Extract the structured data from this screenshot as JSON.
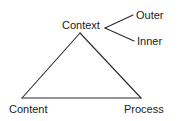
{
  "diagram": {
    "type": "triangle-relationship-diagram",
    "background_color": "#ffffff",
    "line_color": "#2b2b2b",
    "text_color": "#1a1a1a",
    "nodes": [
      {
        "id": "context",
        "label": "Context",
        "position": "apex"
      },
      {
        "id": "content",
        "label": "Content",
        "position": "bottom-left"
      },
      {
        "id": "process",
        "label": "Process",
        "position": "bottom-right"
      },
      {
        "id": "outer",
        "label": "Outer",
        "position": "right-upper"
      },
      {
        "id": "inner",
        "label": "Inner",
        "position": "right-lower"
      }
    ],
    "edges": [
      {
        "from": "context",
        "to": "content"
      },
      {
        "from": "content",
        "to": "process"
      },
      {
        "from": "process",
        "to": "context"
      },
      {
        "from": "context",
        "to": "outer"
      },
      {
        "from": "context",
        "to": "inner"
      }
    ]
  }
}
